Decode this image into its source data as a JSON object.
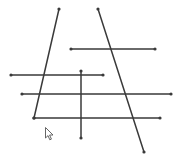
{
  "canvas": {
    "width": 181,
    "height": 158,
    "background": "#ffffff",
    "stroke_color": "#3a3a3a",
    "stroke_width": 1.5,
    "endpoint_radius": 1.6
  },
  "segments": [
    {
      "id": "seg-1",
      "x1": 59,
      "y1": 9,
      "x2": 34,
      "y2": 118
    },
    {
      "id": "seg-2",
      "x1": 98,
      "y1": 9,
      "x2": 144,
      "y2": 152
    },
    {
      "id": "seg-3",
      "x1": 71,
      "y1": 49,
      "x2": 155,
      "y2": 49
    },
    {
      "id": "seg-4",
      "x1": 11,
      "y1": 75,
      "x2": 103,
      "y2": 75
    },
    {
      "id": "seg-5",
      "x1": 22,
      "y1": 94,
      "x2": 171,
      "y2": 94
    },
    {
      "id": "seg-6",
      "x1": 34,
      "y1": 118,
      "x2": 160,
      "y2": 118
    },
    {
      "id": "seg-7",
      "x1": 81,
      "y1": 71,
      "x2": 81,
      "y2": 138
    }
  ],
  "cursor": {
    "icon": "arrow-pointer-icon",
    "x": 45,
    "y": 127
  }
}
